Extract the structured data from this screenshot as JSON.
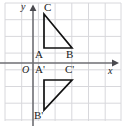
{
  "figure": {
    "width": 124,
    "height": 132,
    "background_color": "#ffffff",
    "grid": {
      "visible": true,
      "color": "#d8d8dc",
      "spacing_px": 16.7,
      "x_lines": [
        5,
        21.7,
        38.4,
        55.1,
        71.8,
        88.5,
        105.2,
        121
      ],
      "y_lines": [
        3,
        19.7,
        36.4,
        53.1,
        69.8,
        86.5,
        103.2,
        119.9
      ]
    },
    "axes": {
      "color": "#6e6e73",
      "origin_px": {
        "x": 33,
        "y": 63
      },
      "x_axis": {
        "y_px": 63,
        "x_start_px": 0,
        "x_end_px": 118,
        "arrow": true
      },
      "y_axis": {
        "x_px": 33,
        "y_start_px": 124,
        "y_end_px": 8,
        "arrow": true
      }
    },
    "axis_labels": {
      "x": "x",
      "y": "y",
      "origin": "O"
    },
    "shapes": {
      "stroke_color": "#111111",
      "stroke_width": 1.6,
      "triangle_1": {
        "name": "ABC",
        "vertices": [
          {
            "label": "A",
            "x_px": 44,
            "y_px": 48
          },
          {
            "label": "B",
            "x_px": 72,
            "y_px": 48
          },
          {
            "label": "C",
            "x_px": 44,
            "y_px": 14
          }
        ]
      },
      "triangle_2": {
        "name": "A'B'C'",
        "vertices": [
          {
            "label": "A'",
            "x_px": 44,
            "y_px": 80
          },
          {
            "label": "C'",
            "x_px": 72,
            "y_px": 80
          },
          {
            "label": "B'",
            "x_px": 44,
            "y_px": 110
          }
        ]
      }
    },
    "vertex_labels": [
      {
        "id": "A",
        "text": "A",
        "x_px": 36,
        "y_px": 50
      },
      {
        "id": "B",
        "text": "B",
        "x_px": 67,
        "y_px": 50
      },
      {
        "id": "C",
        "text": "C",
        "x_px": 44,
        "y_px": 3
      },
      {
        "id": "Ap",
        "text": "A'",
        "x_px": 36,
        "y_px": 64
      },
      {
        "id": "Cp",
        "text": "C'",
        "x_px": 66,
        "y_px": 64
      },
      {
        "id": "Bp",
        "text": "B'",
        "x_px": 35,
        "y_px": 111
      }
    ]
  }
}
